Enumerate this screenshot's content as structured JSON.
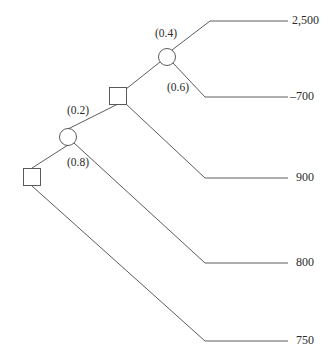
{
  "diagram": {
    "type": "decision-tree",
    "title": "",
    "stroke_color": "#4a4a4a",
    "text_color": "#2b2b2b",
    "background": "#ffffff",
    "node_fill": "#ffffff"
  },
  "nodes": [
    {
      "id": "root-decision",
      "shape": "square",
      "kind": "decision",
      "x": 32,
      "y": 177,
      "size": 17
    },
    {
      "id": "chance-1",
      "shape": "circle",
      "kind": "chance",
      "x": 68,
      "y": 137,
      "r": 8.5
    },
    {
      "id": "decision-2",
      "shape": "square",
      "kind": "decision",
      "x": 118,
      "y": 96,
      "size": 17
    },
    {
      "id": "chance-2",
      "shape": "circle",
      "kind": "chance",
      "x": 167,
      "y": 57,
      "r": 8.5
    }
  ],
  "probabilities": [
    {
      "id": "p-0-4",
      "text": "(0.4)",
      "x": 155,
      "y": 28
    },
    {
      "id": "p-0-6",
      "text": "(0.6)",
      "x": 167,
      "y": 82
    },
    {
      "id": "p-0-2",
      "text": "(0.2)",
      "x": 67,
      "y": 105
    },
    {
      "id": "p-0-8",
      "text": "(0.8)",
      "x": 67,
      "y": 157
    }
  ],
  "payoffs": [
    {
      "id": "payoff-2500",
      "text": "2,500",
      "x": 292,
      "y": 14
    },
    {
      "id": "payoff-minus-700",
      "text": "–700",
      "x": 292,
      "y": 90
    },
    {
      "id": "payoff-900",
      "text": "900",
      "x": 296,
      "y": 171
    },
    {
      "id": "payoff-800",
      "text": "800",
      "x": 296,
      "y": 256
    },
    {
      "id": "payoff-750",
      "text": "750",
      "x": 296,
      "y": 334
    }
  ],
  "branches": [
    {
      "id": "branch-root-to-chance1",
      "points": "32,168 68,145"
    },
    {
      "id": "branch-root-to-750",
      "points": "32,186 205,341 288,341"
    },
    {
      "id": "branch-chance1-to-decision2",
      "points": "68,129 118,104"
    },
    {
      "id": "branch-chance1-to-800",
      "points": "74,143 205,263 288,263"
    },
    {
      "id": "branch-decision2-to-chance2",
      "points": "126,89 160,62"
    },
    {
      "id": "branch-decision2-to-900",
      "points": "126,104 205,178 288,178"
    },
    {
      "id": "branch-chance2-to-2500",
      "points": "172,50 210,21 288,21"
    },
    {
      "id": "branch-chance2-to-minus700",
      "points": "173,63 205,97 288,97"
    }
  ]
}
